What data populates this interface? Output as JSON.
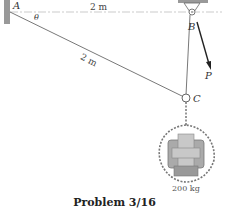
{
  "figure": {
    "points": {
      "A": "A",
      "B": "B",
      "C": "C"
    },
    "angle_label": "θ",
    "dimensions": {
      "AB": "2 m",
      "AC": "2 m"
    },
    "force_label": "P",
    "mass_label": "200 kg",
    "caption": "Problem 3/16"
  },
  "colors": {
    "line": "#555555",
    "wall": "#888888",
    "text": "#222222"
  }
}
